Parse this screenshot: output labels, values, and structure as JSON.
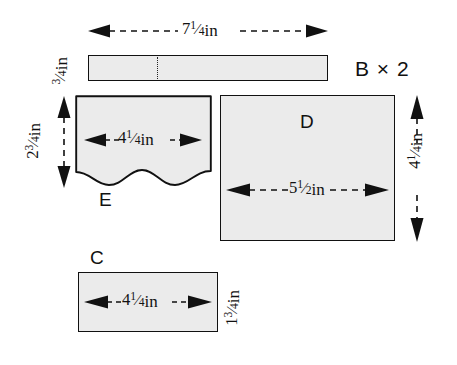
{
  "diagram": {
    "background_color": "#ffffff",
    "piece_fill": "#ebebeb",
    "line_color": "#111111",
    "units": "in"
  },
  "pieces": [
    {
      "id": "B",
      "label": "B × 2",
      "width_label": "7¹⁄₄in",
      "width_whole": "7",
      "width_num": "1",
      "width_den": "4",
      "height_label": "³⁄₄in",
      "height_whole": "",
      "height_num": "3",
      "height_den": "4",
      "shape": "rectangle-with-seam"
    },
    {
      "id": "E",
      "label": "E",
      "width_label": "4¹⁄₄in",
      "width_whole": "4",
      "width_num": "1",
      "width_den": "4",
      "height_label": "2³⁄₄in",
      "height_whole": "2",
      "height_num": "3",
      "height_den": "4",
      "shape": "wavy-bottom-rectangle"
    },
    {
      "id": "D",
      "label": "D",
      "width_label": "5¹⁄₂in",
      "width_whole": "5",
      "width_num": "1",
      "width_den": "2",
      "height_label": "4¹⁄₄in",
      "height_whole": "4",
      "height_num": "1",
      "height_den": "4",
      "shape": "rectangle"
    },
    {
      "id": "C",
      "label": "C",
      "width_label": "4¹⁄₄in",
      "width_whole": "4",
      "width_num": "1",
      "width_den": "4",
      "height_label": "1³⁄₄in",
      "height_whole": "1",
      "height_num": "3",
      "height_den": "4",
      "shape": "rectangle"
    }
  ],
  "units_suffix": "in"
}
